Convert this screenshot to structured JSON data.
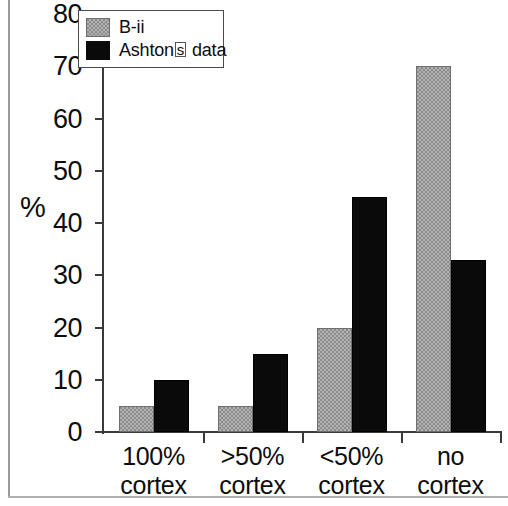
{
  "chart_data": {
    "type": "bar",
    "title": "",
    "xlabel": "",
    "ylabel": "%",
    "ylim": [
      0,
      80
    ],
    "yticks": [
      0,
      10,
      20,
      30,
      40,
      50,
      60,
      70,
      80
    ],
    "grid": false,
    "legend_position": "top-left",
    "categories": [
      "100% cortex",
      ">50% cortex",
      "<50% cortex",
      "no cortex"
    ],
    "category_lines": [
      [
        "100%",
        "cortex"
      ],
      [
        ">50%",
        "cortex"
      ],
      [
        "<50%",
        "cortex"
      ],
      [
        "no",
        "cortex"
      ]
    ],
    "series": [
      {
        "name": "B-ii",
        "color": "#8c8c8c",
        "values": [
          5,
          5,
          20,
          70
        ]
      },
      {
        "name": "Ashton□s data",
        "color": "#0a0a0a",
        "values": [
          10,
          15,
          45,
          33
        ]
      }
    ]
  },
  "legend": {
    "items": [
      {
        "label": "B-ii",
        "swatch": "series-a"
      },
      {
        "label_prefix": "Ashton",
        "label_glyph": "s",
        "label_suffix": "s data",
        "swatch": "series-b"
      }
    ]
  },
  "axis": {
    "y_title": "%",
    "y_tick_labels": [
      "80",
      "70",
      "60",
      "50",
      "40",
      "30",
      "20",
      "10",
      "0"
    ]
  }
}
